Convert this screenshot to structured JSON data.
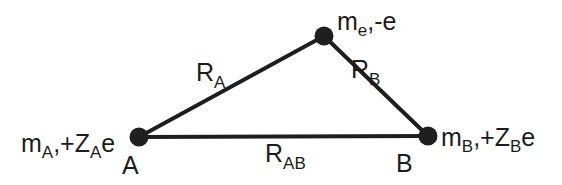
{
  "diagram": {
    "type": "three-body charge triangle",
    "nodes": {
      "A": {
        "name": "A",
        "mass_base": "m",
        "mass_sub": "A",
        "charge_prefix": ",+Z",
        "charge_sub": "A",
        "charge_suffix": "e",
        "center": [
          139,
          137
        ]
      },
      "electron": {
        "mass_base": "m",
        "mass_sub": "e",
        "charge_text": ",-e",
        "center": [
          324,
          36
        ]
      },
      "B": {
        "name": "B",
        "mass_base": "m",
        "mass_sub": "B",
        "charge_prefix": ",+Z",
        "charge_sub": "B",
        "charge_suffix": "e",
        "center": [
          428,
          136
        ]
      }
    },
    "edges": {
      "RA": {
        "base": "R",
        "sub": "A",
        "from": "A",
        "to": "electron"
      },
      "RB": {
        "base": "R",
        "sub": "B",
        "from": "electron",
        "to": "B"
      },
      "RAB": {
        "base": "R",
        "sub": "AB",
        "from": "A",
        "to": "B"
      }
    },
    "colors": {
      "ink": "#1e1e1e",
      "background": "#ffffff"
    }
  }
}
